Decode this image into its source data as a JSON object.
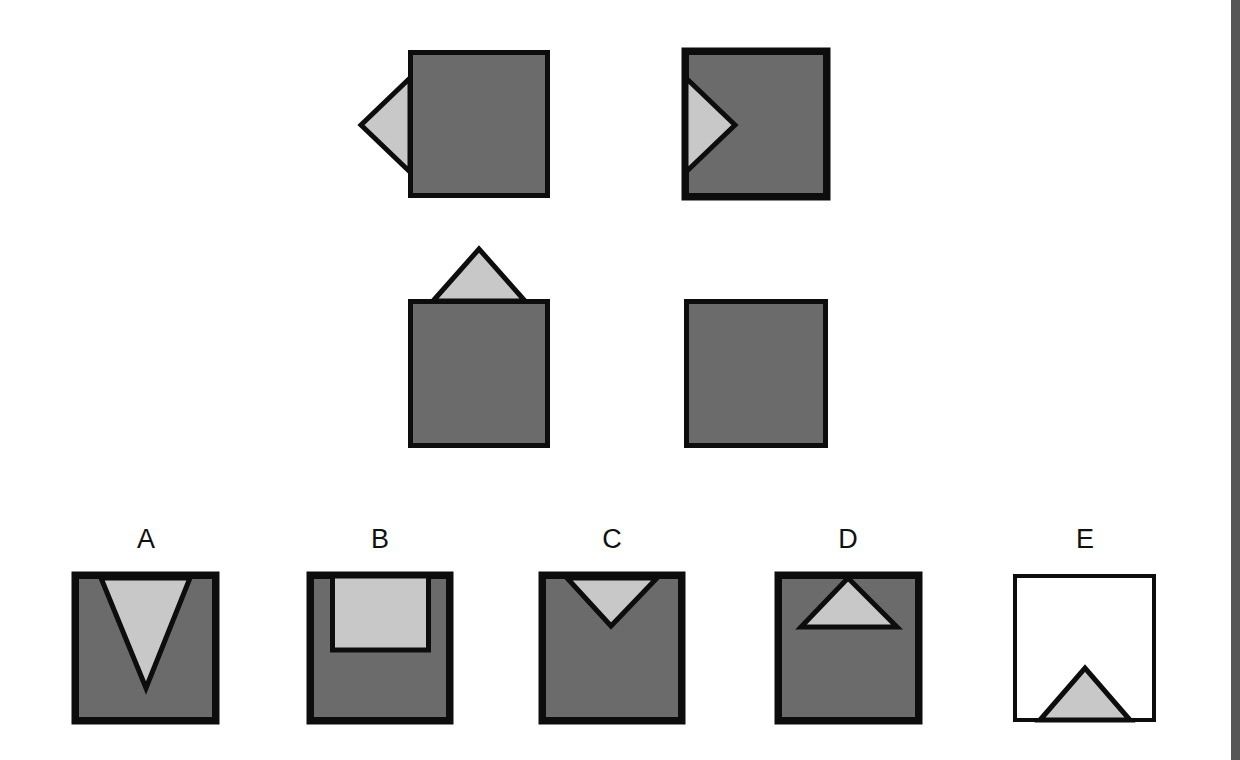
{
  "puzzle": {
    "type": "visual-analogy",
    "colors": {
      "square_fill": "#6b6b6b",
      "shape_fill": "#c8c8c8",
      "outline": "#0d0d0d",
      "blank_fill": "#ffffff",
      "edge_strip": "#575757"
    },
    "question": {
      "cells": [
        {
          "id": "q1",
          "description": "dark square with light triangle attached outside on left edge, pointing left"
        },
        {
          "id": "q2",
          "description": "dark square with light triangle inside on left edge, pointing right"
        },
        {
          "id": "q3",
          "description": "dark square with light triangle attached outside on top edge, pointing up"
        },
        {
          "id": "q4",
          "description": "dark square, empty (answer slot)"
        }
      ]
    },
    "options": [
      {
        "label": "A",
        "description": "dark square with tall light triangle inside from top edge, pointing down"
      },
      {
        "label": "B",
        "description": "dark square with light rectangle inside against top edge"
      },
      {
        "label": "C",
        "description": "dark square with light triangle inside on top edge, pointing down"
      },
      {
        "label": "D",
        "description": "dark square with light triangle inside near top, pointing up"
      },
      {
        "label": "E",
        "description": "white square with light triangle on bottom edge, pointing up"
      }
    ]
  }
}
